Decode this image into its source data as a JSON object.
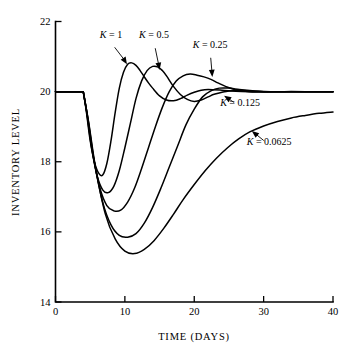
{
  "chart_data": {
    "type": "line",
    "title": "",
    "xlabel": "TIME (DAYS)",
    "ylabel": "INVENTORY LEVEL",
    "xlim": [
      0,
      40
    ],
    "ylim": [
      14,
      22
    ],
    "xticks": [
      0,
      10,
      20,
      30,
      40
    ],
    "yticks": [
      14,
      16,
      18,
      20,
      22
    ],
    "xtick_labels": [
      "0",
      "10",
      "20",
      "30",
      "40"
    ],
    "ytick_labels": [
      "14",
      "16",
      "18",
      "20",
      "22"
    ],
    "grid": false,
    "legend_position": "inline-annotations",
    "series": [
      {
        "name": "K = 1",
        "label_text": "K = 1",
        "x": [
          0,
          2,
          4,
          4.4,
          5,
          5.6,
          6.2,
          6.8,
          7.4,
          8,
          8.6,
          9.2,
          9.8,
          10.4,
          11,
          11.6,
          12.2,
          12.8,
          13.4,
          14,
          15,
          16,
          17,
          18,
          19,
          20,
          21,
          22,
          24,
          26,
          28,
          30,
          34,
          40
        ],
        "y": [
          20,
          20,
          20,
          19.5,
          18.6,
          18.0,
          17.68,
          17.62,
          17.95,
          18.6,
          19.4,
          20.1,
          20.55,
          20.78,
          20.82,
          20.75,
          20.6,
          20.42,
          20.25,
          20.1,
          19.88,
          19.76,
          19.74,
          19.8,
          19.9,
          19.98,
          20.04,
          20.06,
          20.04,
          20.01,
          20.0,
          20.0,
          20.0,
          20.0
        ]
      },
      {
        "name": "K = 0.5",
        "label_text": "K = 0.5",
        "x": [
          0,
          2,
          4,
          4.5,
          5.2,
          6,
          6.8,
          7.6,
          8.4,
          9.2,
          10,
          10.8,
          11.6,
          12.4,
          13.2,
          14,
          14.8,
          15.4,
          16,
          17,
          18,
          19,
          20,
          21,
          22,
          23,
          25,
          27,
          29,
          31,
          35,
          40
        ],
        "y": [
          20,
          20,
          20,
          19.4,
          18.4,
          17.6,
          17.2,
          17.12,
          17.3,
          17.75,
          18.4,
          19.1,
          19.8,
          20.3,
          20.6,
          20.72,
          20.7,
          20.6,
          20.45,
          20.15,
          19.92,
          19.78,
          19.72,
          19.76,
          19.85,
          19.93,
          20.02,
          20.03,
          20.01,
          20.0,
          20.0,
          20.0
        ]
      },
      {
        "name": "K = 0.25",
        "label_text": "K = 0.25",
        "x": [
          0,
          2,
          4,
          4.6,
          5.4,
          6.4,
          7.4,
          8.4,
          9.4,
          10.4,
          11.4,
          12.4,
          13.4,
          14.4,
          15.4,
          16.4,
          17.4,
          18.4,
          19.4,
          20.4,
          21.4,
          22.4,
          23.4,
          24.5,
          26,
          28,
          30,
          33,
          36,
          40
        ],
        "y": [
          20,
          20,
          20,
          19.3,
          18.2,
          17.25,
          16.75,
          16.6,
          16.62,
          16.85,
          17.25,
          17.8,
          18.4,
          19.0,
          19.55,
          20.0,
          20.3,
          20.45,
          20.5,
          20.47,
          20.42,
          20.35,
          20.25,
          20.15,
          20.05,
          20.0,
          19.99,
          20.0,
          20.0,
          20.0
        ]
      },
      {
        "name": "K = 0.125",
        "label_text": "K = 0.125",
        "x": [
          0,
          2,
          4,
          4.7,
          5.6,
          6.8,
          8,
          9.2,
          10.4,
          11.6,
          12.8,
          14,
          15.2,
          16.4,
          17.6,
          18.8,
          20,
          21.2,
          22.4,
          23.6,
          25,
          26.5,
          28,
          30,
          32,
          35,
          40
        ],
        "y": [
          20,
          20,
          20,
          19.2,
          18.0,
          16.85,
          16.2,
          15.9,
          15.85,
          15.95,
          16.25,
          16.7,
          17.25,
          17.85,
          18.45,
          19.05,
          19.5,
          19.85,
          20.02,
          20.1,
          20.1,
          20.06,
          20.03,
          20.0,
          20.0,
          20.0,
          20.0
        ]
      },
      {
        "name": "K = 0.0625",
        "label_text": "K = 0.0625",
        "x": [
          0,
          2,
          4,
          4.8,
          5.8,
          7.2,
          8.6,
          10,
          11.4,
          12.8,
          14.2,
          15.6,
          17,
          18.4,
          20,
          21.6,
          23.2,
          24.8,
          26.4,
          28,
          30,
          32,
          34,
          36,
          38,
          40
        ],
        "y": [
          20,
          20,
          20,
          19.1,
          17.8,
          16.5,
          15.8,
          15.45,
          15.38,
          15.5,
          15.75,
          16.1,
          16.5,
          16.92,
          17.35,
          17.75,
          18.1,
          18.4,
          18.65,
          18.85,
          19.02,
          19.15,
          19.25,
          19.32,
          19.38,
          19.42
        ]
      }
    ],
    "annotations": [
      {
        "text": "K = 1",
        "label_x": 8.0,
        "label_y": 21.52,
        "arrow_to_x": 10.3,
        "arrow_to_y": 20.78
      },
      {
        "text": "K = 0.5",
        "label_x": 14.2,
        "label_y": 21.52,
        "arrow_to_x": 15.0,
        "arrow_to_y": 20.62
      },
      {
        "text": "K = 0.25",
        "label_x": 22.3,
        "label_y": 21.25,
        "arrow_to_x": 22.6,
        "arrow_to_y": 20.42
      },
      {
        "text": "K = 0.125",
        "label_x": 26.6,
        "label_y": 19.58,
        "arrow_to_x": 24.3,
        "arrow_to_y": 19.88
      },
      {
        "text": "K = 0.0625",
        "label_x": 30.8,
        "label_y": 18.48,
        "arrow_to_x": 28.3,
        "arrow_to_y": 18.88
      }
    ]
  }
}
